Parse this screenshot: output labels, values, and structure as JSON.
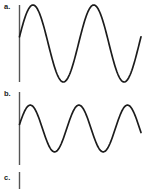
{
  "figure": {
    "title": "",
    "background_color": "#ffffff",
    "wave_color": "#1c1c1c",
    "axis_color": "#555555",
    "width": 150,
    "height": 194
  },
  "panels": [
    {
      "id": "a",
      "label": "a.",
      "description": "high-amplitude waveform, two cycles"
    },
    {
      "id": "b",
      "label": "b.",
      "description": "lower-amplitude waveform, two and a half cycles"
    },
    {
      "id": "c",
      "label": "c.",
      "description": "flat, no waveform drawn"
    }
  ],
  "chart_data": [
    {
      "type": "line",
      "panel": "a",
      "title": "a.",
      "xlabel": "",
      "ylabel": "",
      "grid": false,
      "legend": "none",
      "axis": {
        "vertical_only": true,
        "x_position": 0,
        "y_top": 5,
        "y_bottom": 82
      },
      "xlim": [
        0,
        124
      ],
      "ylim": [
        -1.05,
        1.05
      ],
      "waveform": {
        "shape": "sine",
        "cycles": 2,
        "amplitude": 1.0,
        "phase_deg": 10,
        "samples": 160
      },
      "x": [
        0,
        8,
        16,
        24,
        31,
        39,
        47,
        54,
        62,
        70,
        78,
        85,
        93,
        101,
        109,
        116,
        124
      ],
      "values": [
        0.18,
        0.63,
        0.92,
        1.0,
        0.85,
        0.44,
        -0.06,
        -0.54,
        -0.87,
        -1.0,
        -0.82,
        -0.41,
        0.1,
        0.58,
        0.9,
        1.0,
        0.72
      ]
    },
    {
      "type": "line",
      "panel": "b",
      "title": "b.",
      "xlabel": "",
      "ylabel": "",
      "grid": false,
      "legend": "none",
      "axis": {
        "vertical_only": true,
        "x_position": 0,
        "y_top": 4,
        "y_bottom": 77
      },
      "xlim": [
        0,
        124
      ],
      "ylim": [
        -1.05,
        1.05
      ],
      "waveform": {
        "shape": "sine",
        "cycles": 2.5,
        "amplitude": 0.78,
        "phase_deg": 10,
        "samples": 160
      },
      "x": [
        0,
        8,
        16,
        24,
        31,
        39,
        47,
        54,
        62,
        70,
        78,
        85,
        93,
        101,
        109,
        116,
        124
      ],
      "values": [
        0.1,
        0.55,
        0.86,
        0.97,
        0.78,
        0.3,
        -0.25,
        -0.71,
        -0.96,
        -0.9,
        -0.52,
        0.02,
        0.55,
        0.9,
        0.96,
        0.63,
        0.05
      ]
    },
    {
      "type": "line",
      "panel": "c",
      "title": "c.",
      "xlabel": "",
      "ylabel": "",
      "grid": false,
      "legend": "none",
      "axis": {
        "vertical_only": true,
        "x_position": 0,
        "y_top": 4,
        "y_bottom": 21
      },
      "xlim": [
        0,
        124
      ],
      "ylim": [
        -1.05,
        1.05
      ],
      "waveform": {
        "shape": "none",
        "cycles": 0,
        "amplitude": 0,
        "phase_deg": 0,
        "samples": 0
      },
      "x": [],
      "values": []
    }
  ]
}
